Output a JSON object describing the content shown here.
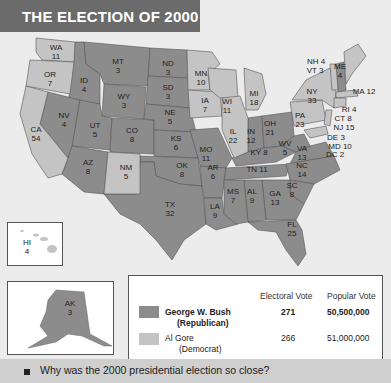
{
  "header": {
    "title": "THE ELECTION OF 2000"
  },
  "colors": {
    "republican": "#8c8c8c",
    "democrat": "#c4c4c4",
    "background": "#ececec",
    "title_bar": "#6b6b6b"
  },
  "states": {
    "WA": "WA\n11",
    "OR": "OR\n7",
    "CA": "CA\n54",
    "ID": "ID\n4",
    "NV": "NV\n4",
    "MT": "MT\n3",
    "WY": "WY\n3",
    "UT": "UT\n5",
    "AZ": "AZ\n8",
    "CO": "CO\n8",
    "NM": "NM\n5",
    "ND": "ND\n3",
    "SD": "SD\n3",
    "NE": "NE\n5",
    "KS": "KS\n6",
    "OK": "OK\n8",
    "TX": "TX\n32",
    "MN": "MN\n10",
    "IA": "IA\n7",
    "MO": "MO\n11",
    "AR": "AR\n6",
    "LA": "LA\n9",
    "WI": "WI\n11",
    "IL": "IL\n22",
    "MI": "MI\n18",
    "IN": "IN\n12",
    "OH": "OH\n21",
    "KY": "KY 8",
    "TN": "TN 11",
    "MS": "MS\n7",
    "AL": "AL\n9",
    "GA": "GA\n13",
    "FL": "FL\n25",
    "SC": "SC\n8",
    "NC": "NC\n14",
    "VA": "VA\n13",
    "WV": "WV\n5",
    "PA": "PA\n23",
    "NY": "NY\n33",
    "ME": "ME\n4",
    "NH": "NH 4",
    "VT": "VT 3",
    "MA": "MA 12",
    "RI": "RI 4",
    "CT": "CT 8",
    "NJ": "NJ 15",
    "DE": "DE 3",
    "MD": "MD 10",
    "DC": "DC 2",
    "HI": "HI\n4",
    "AK": "AK\n3"
  },
  "legend": {
    "col_electoral": "Electoral Vote",
    "col_popular": "Popular Vote",
    "rows": [
      {
        "name": "George W. Bush",
        "party": "(Republican)",
        "electoral": "271",
        "popular": "50,500,000"
      },
      {
        "name": "Al Gore",
        "party": "(Democrat)",
        "electoral": "266",
        "popular": "51,000,000"
      }
    ]
  },
  "question": {
    "text": "Why was the 2000 presidential election so close?"
  }
}
